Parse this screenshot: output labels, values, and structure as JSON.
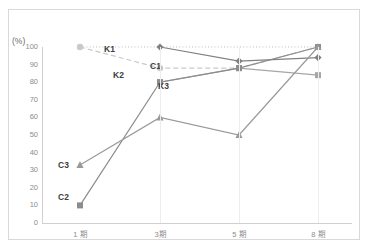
{
  "chart_data": {
    "type": "line",
    "title": "",
    "xlabel": "",
    "ylabel": "(%)",
    "ylim": [
      0,
      100
    ],
    "ytick_step": 10,
    "grid": "vertical-only",
    "legend": "inline-labels",
    "categories": [
      "1 期",
      "3期",
      "5 期",
      "8 期"
    ],
    "ytick_labels": [
      "100",
      "90",
      "80",
      "70",
      "60",
      "50",
      "40",
      "30",
      "20",
      "10",
      "0"
    ],
    "series": [
      {
        "name": "K1",
        "style": "dotted",
        "color": "#bfbfbf",
        "marker": "none",
        "values": [
          100,
          100,
          100,
          100
        ]
      },
      {
        "name": "K2",
        "style": "dashed",
        "color": "#c9c9c9",
        "marker": "circle",
        "values": [
          100,
          88,
          88,
          100
        ]
      },
      {
        "name": "C1",
        "style": "solid",
        "color": "#808080",
        "marker": "diamond",
        "values": [
          null,
          100,
          92,
          94
        ]
      },
      {
        "name": "K3",
        "style": "solid",
        "color": "#a6a6a6",
        "marker": "square",
        "values": [
          null,
          80,
          88,
          84
        ]
      },
      {
        "name": "C2",
        "style": "solid",
        "color": "#8c8c8c",
        "marker": "square",
        "values": [
          10,
          80,
          88,
          100
        ]
      },
      {
        "name": "C3",
        "style": "solid",
        "color": "#9a9a9a",
        "marker": "triangle",
        "values": [
          33,
          60,
          50,
          100
        ]
      }
    ],
    "annotations": [
      {
        "text": "K1",
        "x_px": 104,
        "y_px": 44
      },
      {
        "text": "K2",
        "x_px": 113,
        "y_px": 70
      },
      {
        "text": "C1",
        "x_px": 150,
        "y_px": 61
      },
      {
        "text": "K3",
        "x_px": 158,
        "y_px": 81
      },
      {
        "text": "C3",
        "x_px": 58,
        "y_px": 160
      },
      {
        "text": "C2",
        "x_px": 58,
        "y_px": 192
      }
    ]
  },
  "axis": {
    "unit": "(%)"
  }
}
